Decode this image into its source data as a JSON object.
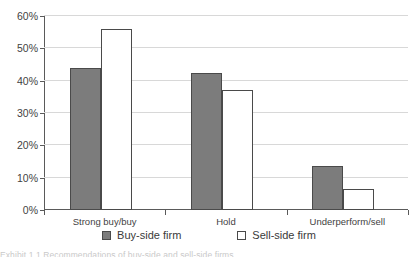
{
  "chart_data": {
    "type": "bar",
    "title": "",
    "subtitle": "",
    "xlabel": "",
    "ylabel": "",
    "ylim": [
      0,
      60
    ],
    "ytick_step": 10,
    "ytick_labels": [
      "0%",
      "10%",
      "20%",
      "30%",
      "40%",
      "50%",
      "60%"
    ],
    "ytick_values": [
      0,
      10,
      20,
      30,
      40,
      50,
      60
    ],
    "grid": true,
    "legend_position": "bottom-center",
    "categories": [
      "Strong buy/buy",
      "Hold",
      "Underperform/sell"
    ],
    "series": [
      {
        "name": "Buy-side firm",
        "color": "#7c7c7c",
        "style": "filled",
        "values": [
          44,
          42.5,
          13.5
        ]
      },
      {
        "name": "Sell-side firm",
        "color": "#ffffff",
        "style": "hollow",
        "values": [
          56,
          37,
          6.5
        ]
      }
    ]
  },
  "legend": {
    "entries": [
      {
        "label": "Buy-side firm",
        "swatch": "filled-square-swatch"
      },
      {
        "label": "Sell-side firm",
        "swatch": "hollow-square-swatch"
      }
    ]
  },
  "caption": {
    "clipped_text": "Exhibit 1.1   Recommendations of buy-side and sell-side firms"
  }
}
